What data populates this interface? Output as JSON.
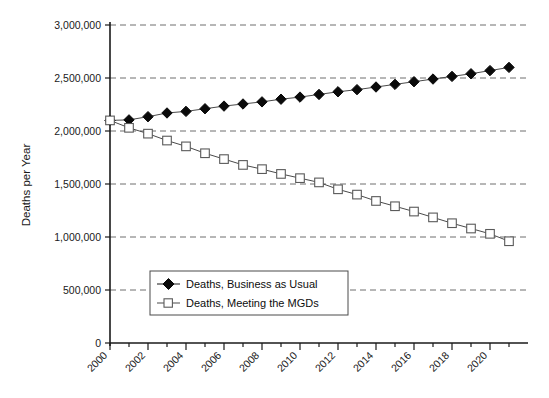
{
  "chart_data": {
    "type": "line",
    "title": "",
    "xlabel": "",
    "ylabel": "Deaths per Year",
    "xlim": [
      2000,
      2022
    ],
    "ylim": [
      0,
      3000000
    ],
    "grid": true,
    "legend_position": "inside-lower-left",
    "y_ticks": [
      "0",
      "500,000",
      "1,000,000",
      "1,500,000",
      "2,000,000",
      "2,500,000",
      "3,000,000"
    ],
    "y_tick_values": [
      0,
      500000,
      1000000,
      1500000,
      2000000,
      2500000,
      3000000
    ],
    "x_ticks": [
      "2000",
      "2002",
      "2004",
      "2006",
      "2008",
      "2010",
      "2012",
      "2014",
      "2016",
      "2018",
      "2020"
    ],
    "x_tick_values": [
      2000,
      2002,
      2004,
      2006,
      2008,
      2010,
      2012,
      2014,
      2016,
      2018,
      2020
    ],
    "x_minor_values": [
      2001,
      2003,
      2005,
      2007,
      2009,
      2011,
      2013,
      2015,
      2017,
      2019,
      2021
    ],
    "x": [
      2000,
      2001,
      2002,
      2003,
      2004,
      2005,
      2006,
      2007,
      2008,
      2009,
      2010,
      2011,
      2012,
      2013,
      2014,
      2015,
      2016,
      2017,
      2018,
      2019,
      2020,
      2021
    ],
    "series": [
      {
        "name": "Deaths, Business as Usual",
        "marker": "filled-diamond",
        "values": [
          2100000,
          2105000,
          2135000,
          2170000,
          2185000,
          2210000,
          2235000,
          2255000,
          2275000,
          2300000,
          2320000,
          2345000,
          2370000,
          2390000,
          2415000,
          2440000,
          2465000,
          2490000,
          2515000,
          2540000,
          2570000,
          2600000
        ]
      },
      {
        "name": "Deaths, Meeting the MGDs",
        "marker": "open-square",
        "values": [
          2100000,
          2030000,
          1975000,
          1910000,
          1855000,
          1790000,
          1735000,
          1680000,
          1640000,
          1595000,
          1555000,
          1515000,
          1450000,
          1400000,
          1340000,
          1290000,
          1240000,
          1185000,
          1130000,
          1080000,
          1030000,
          960000
        ]
      }
    ]
  },
  "legend": {
    "items": [
      {
        "label": "Deaths, Business as Usual",
        "marker": "filled-diamond"
      },
      {
        "label": "Deaths, Meeting the MGDs",
        "marker": "open-square"
      }
    ]
  },
  "colors": {
    "series_1": "#0a0a0a",
    "series_2": "#5a5a5a",
    "grid": "#6e6e6e",
    "axis": "#1a1a1a",
    "background": "#ffffff"
  }
}
